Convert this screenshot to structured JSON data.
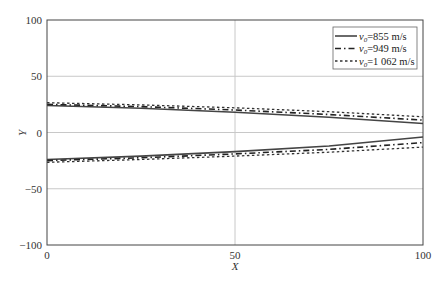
{
  "chart_data": {
    "type": "line",
    "title": "",
    "xlabel": "X",
    "ylabel": "Y",
    "xlim": [
      0,
      100
    ],
    "ylim": [
      -100,
      100
    ],
    "xticks": [
      0,
      50,
      100
    ],
    "yticks": [
      100,
      50,
      0,
      -50,
      -100
    ],
    "grid": true,
    "legend_position": "upper right",
    "x": [
      0,
      25,
      50,
      75,
      100
    ],
    "series": [
      {
        "name": "v0=855 m/s",
        "style": "solid",
        "upper": [
          24,
          21.5,
          18,
          13.5,
          8
        ],
        "lower": [
          -24,
          -21,
          -17,
          -12,
          -4
        ]
      },
      {
        "name": "v0=949 m/s",
        "style": "dashdot",
        "upper": [
          25,
          23,
          20,
          16,
          11
        ],
        "lower": [
          -25,
          -22.5,
          -19,
          -15,
          -9
        ]
      },
      {
        "name": "v0=1 062 m/s",
        "style": "dotted",
        "upper": [
          26.5,
          24.5,
          22,
          18.5,
          14
        ],
        "lower": [
          -26.5,
          -24,
          -21,
          -17.5,
          -13
        ]
      }
    ]
  },
  "legend": {
    "items": [
      {
        "prefix": "v",
        "sub": "0",
        "suffix": "=855 m/s"
      },
      {
        "prefix": "v",
        "sub": "0",
        "suffix": "=949 m/s"
      },
      {
        "prefix": "v",
        "sub": "0",
        "suffix": "=1 062 m/s"
      }
    ]
  },
  "axes": {
    "x_title": "X",
    "y_title": "Y",
    "x_ticks": [
      "0",
      "50",
      "100"
    ],
    "y_ticks": [
      "100",
      "50",
      "0",
      "−50",
      "−100"
    ]
  }
}
